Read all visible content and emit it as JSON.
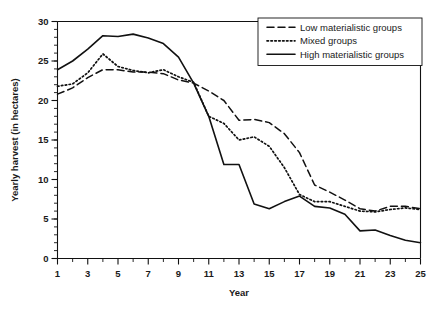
{
  "chart_data": {
    "type": "line",
    "title": "",
    "xlabel": "Year",
    "ylabel": "Yearly harvest (in hectares)",
    "xlim": [
      1,
      25
    ],
    "ylim": [
      0,
      30
    ],
    "grid": false,
    "legend_position": "top-right",
    "x_major_ticks": [
      1,
      3,
      5,
      7,
      9,
      11,
      13,
      15,
      17,
      19,
      21,
      23,
      25
    ],
    "x_minor_ticks": [
      2,
      4,
      6,
      8,
      10,
      12,
      14,
      16,
      18,
      20,
      22,
      24
    ],
    "y_major_ticks": [
      0,
      5,
      10,
      15,
      20,
      25,
      30
    ],
    "y_minor_step": 1,
    "x": [
      1,
      2,
      3,
      4,
      5,
      6,
      7,
      8,
      9,
      10,
      11,
      12,
      13,
      14,
      15,
      16,
      17,
      18,
      19,
      20,
      21,
      22,
      23,
      24,
      25
    ],
    "series": [
      {
        "name": "Low materialistic groups",
        "style": "dashed",
        "values": [
          20.8,
          21.6,
          22.9,
          23.9,
          23.9,
          23.6,
          23.6,
          23.4,
          22.6,
          22.2,
          21.2,
          20.0,
          17.5,
          17.6,
          17.2,
          15.8,
          13.4,
          9.3,
          8.4,
          7.4,
          6.3,
          6.0,
          6.6,
          6.6,
          6.3
        ]
      },
      {
        "name": "Mixed groups",
        "style": "dotted",
        "values": [
          21.8,
          22.1,
          23.5,
          25.9,
          24.3,
          23.8,
          23.5,
          23.9,
          23.0,
          22.3,
          18.0,
          17.1,
          15.0,
          15.4,
          14.2,
          11.5,
          8.1,
          7.2,
          7.2,
          6.6,
          6.0,
          5.9,
          6.2,
          6.4,
          6.2
        ]
      },
      {
        "name": "High materialistic groups",
        "style": "solid",
        "values": [
          23.9,
          25.0,
          26.5,
          28.2,
          28.1,
          28.4,
          27.9,
          27.2,
          25.5,
          22.2,
          18.0,
          11.9,
          11.9,
          6.9,
          6.3,
          7.2,
          7.9,
          6.6,
          6.4,
          5.6,
          3.5,
          3.6,
          2.9,
          2.3,
          2.0
        ]
      }
    ]
  },
  "legend": {
    "items": [
      {
        "label": "Low materialistic groups",
        "style": "dashed"
      },
      {
        "label": "Mixed groups",
        "style": "dotted"
      },
      {
        "label": "High materialistic groups",
        "style": "solid"
      }
    ]
  },
  "axes": {
    "x_title": "Year",
    "y_title": "Yearly harvest (in hectares)",
    "x_tick_labels": [
      "1",
      "3",
      "5",
      "7",
      "9",
      "11",
      "13",
      "15",
      "17",
      "19",
      "21",
      "23",
      "25"
    ],
    "y_tick_labels": [
      "0",
      "5",
      "10",
      "15",
      "20",
      "25",
      "30"
    ]
  },
  "colors": {
    "ink": "#111111",
    "background": "#ffffff"
  }
}
